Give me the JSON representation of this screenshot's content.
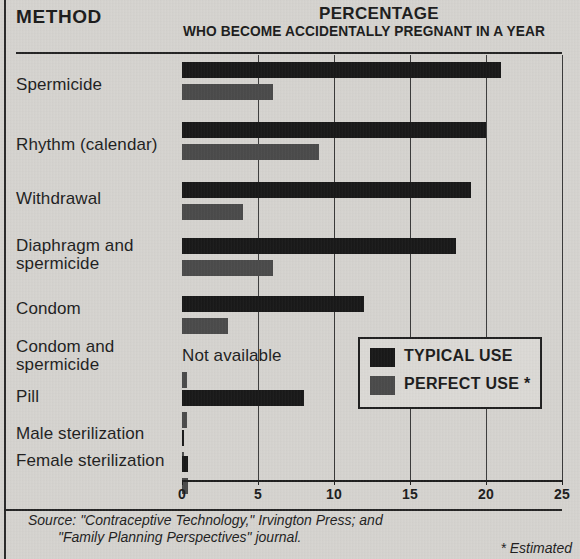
{
  "header": {
    "method_title": "METHOD",
    "percentage_title": "PERCENTAGE",
    "percentage_subtitle": "WHO BECOME ACCIDENTALLY PREGNANT IN A YEAR"
  },
  "legend": {
    "typical_label": "TYPICAL USE",
    "perfect_label": "PERFECT USE *",
    "typical_color": "#171717",
    "perfect_color": "#4a4a4a"
  },
  "footer": {
    "source_line1": "Source: \"Contraceptive Technology,\" Irvington Press; and",
    "source_line2": "\"Family Planning Perspectives\" journal.",
    "estimated_note": "* Estimated"
  },
  "axis": {
    "ticks": [
      "0",
      "5",
      "10",
      "15",
      "20",
      "25"
    ],
    "min": 0,
    "max": 25,
    "step": 5
  },
  "not_available_text": "Not available",
  "chart_data": {
    "type": "bar",
    "orientation": "horizontal",
    "title": "PERCENTAGE",
    "subtitle": "WHO BECOME ACCIDENTALLY PREGNANT IN A YEAR",
    "xlabel": "",
    "ylabel": "METHOD",
    "xlim": [
      0,
      25
    ],
    "xticks": [
      0,
      5,
      10,
      15,
      20,
      25
    ],
    "grid": true,
    "legend_position": "center-right",
    "categories": [
      "Spermicide",
      "Rhythm (calendar)",
      "Withdrawal",
      "Diaphragm and\nspermicide",
      "Condom",
      "Condom and\nspermicide",
      "Pill",
      "Male sterilization",
      "Female sterilization"
    ],
    "series": [
      {
        "name": "TYPICAL USE",
        "color": "#171717",
        "values": [
          21,
          20,
          19,
          18,
          12,
          null,
          8,
          0.15,
          0.4
        ]
      },
      {
        "name": "PERFECT USE *",
        "color": "#4a4a4a",
        "values": [
          6,
          9,
          4,
          6,
          3,
          0.3,
          0.3,
          0.1,
          0.4
        ]
      }
    ],
    "annotations": [
      {
        "text": "Not available",
        "category": "Condom and spermicide",
        "series": "TYPICAL USE"
      }
    ],
    "source": "Source: \"Contraceptive Technology,\" Irvington Press; and \"Family Planning Perspectives\" journal.",
    "note": "* Estimated"
  },
  "rows": [
    {
      "label": "Spermicide",
      "typical": 21,
      "perfect": 6
    },
    {
      "label": "Rhythm (calendar)",
      "typical": 20,
      "perfect": 9
    },
    {
      "label": "Withdrawal",
      "typical": 19,
      "perfect": 4
    },
    {
      "label": "Diaphragm and\nspermicide",
      "typical": 18,
      "perfect": 6
    },
    {
      "label": "Condom",
      "typical": 12,
      "perfect": 3
    },
    {
      "label": "Condom and\nspermicide",
      "typical": null,
      "perfect": 0.3
    },
    {
      "label": "Pill",
      "typical": 8,
      "perfect": 0.3
    },
    {
      "label": "Male sterilization",
      "typical": 0.15,
      "perfect": 0.1
    },
    {
      "label": "Female sterilization",
      "typical": 0.4,
      "perfect": 0.4
    }
  ]
}
